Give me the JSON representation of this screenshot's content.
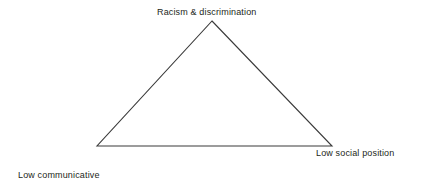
{
  "figure": {
    "type": "triangle-diagram",
    "background_color": "#ffffff",
    "stroke_color": "#3a3a3a",
    "text_color": "#231f20",
    "width": 423,
    "height": 179
  },
  "diagram": {
    "shape": "triangle",
    "vertices": {
      "apex": {
        "x": 212,
        "y": 21
      },
      "bottom_left": {
        "x": 97,
        "y": 146
      },
      "bottom_right": {
        "x": 332,
        "y": 146
      }
    },
    "labels": {
      "apex": "Racism & discrimination",
      "bottom_left_line1": "Low communicative",
      "bottom_left_line2": "power",
      "bottom_right": "Low social position"
    }
  }
}
